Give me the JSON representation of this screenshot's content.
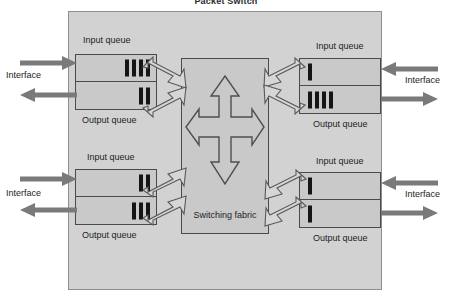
{
  "title": "Packet Switch",
  "colors": {
    "outer_container": "#d2d2d2",
    "module_fill": "#c9c9c9",
    "border": "#4a4a4a",
    "packet": "#151515",
    "solid_arrow": "#7a7a7a",
    "outline_arrow_fill": "#d6d6d6"
  },
  "fabric": {
    "label": "Switching fabric",
    "cross_icon": "four-way-arrow-icon"
  },
  "labels": {
    "input_queue": "Input queue",
    "output_queue": "Output queue",
    "interface": "Interface"
  },
  "interfaces": [
    {
      "id": "top-left",
      "side": "left",
      "position": "top",
      "label": "Interface",
      "input_queue": {
        "label": "Input queue",
        "packets": 4
      },
      "output_queue": {
        "label": "Output queue",
        "packets": 2
      },
      "in_arrow": "arrow-right-icon",
      "out_arrow": "arrow-left-icon"
    },
    {
      "id": "top-right",
      "side": "right",
      "position": "top",
      "label": "Interface",
      "input_queue": {
        "label": "Input queue",
        "packets": 1
      },
      "output_queue": {
        "label": "Output queue",
        "packets": 4
      },
      "in_arrow": "arrow-left-icon",
      "out_arrow": "arrow-right-icon"
    },
    {
      "id": "bottom-left",
      "side": "left",
      "position": "bottom",
      "label": "Interface",
      "input_queue": {
        "label": "Input queue",
        "packets": 2
      },
      "output_queue": {
        "label": "Output queue",
        "packets": 3
      },
      "in_arrow": "arrow-right-icon",
      "out_arrow": "arrow-left-icon"
    },
    {
      "id": "bottom-right",
      "side": "right",
      "position": "bottom",
      "label": "Interface",
      "input_queue": {
        "label": "Input queue",
        "packets": 1
      },
      "output_queue": {
        "label": "Output queue",
        "packets": 1
      },
      "in_arrow": "arrow-left-icon",
      "out_arrow": "arrow-right-icon"
    }
  ]
}
